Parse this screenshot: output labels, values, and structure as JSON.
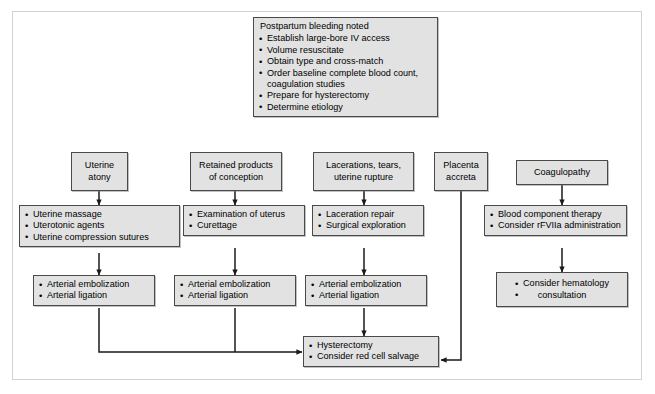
{
  "diagram": {
    "colors": {
      "box_fill": "#e2e2e2",
      "box_border": "#4a4a4a",
      "connector": "#1a1a1a",
      "frame": "#d2d2d2",
      "page_background": "#ffffff"
    }
  },
  "nodes": {
    "initial": {
      "heading": "Postpartum bleeding noted",
      "items": [
        "Establish large-bore IV access",
        "Volume resuscitate",
        "Obtain type and cross-match",
        "Order baseline complete blood count, coagulation studies",
        "Prepare for hysterectomy",
        "Determine etiology"
      ]
    },
    "etiologies": [
      {
        "name": "uterine-atony",
        "line1": "Uterine",
        "line2": "atony"
      },
      {
        "name": "retained-products",
        "line1": "Retained products",
        "line2": "of conception"
      },
      {
        "name": "lacerations",
        "line1": "Lacerations, tears,",
        "line2": "uterine rupture"
      },
      {
        "name": "placenta-accreta",
        "line1": "Placenta",
        "line2": "accreta"
      },
      {
        "name": "coagulopathy",
        "line1": "Coagulopathy",
        "line2": ""
      }
    ],
    "first_line": [
      {
        "name": "atony-first-line",
        "items": [
          "Uterine massage",
          "Uterotonic agents",
          "Uterine compression sutures"
        ]
      },
      {
        "name": "retained-first-line",
        "items": [
          "Examination of uterus",
          "Curettage"
        ]
      },
      {
        "name": "laceration-first-line",
        "items": [
          "Laceration repair",
          "Surgical exploration"
        ]
      },
      {
        "name": "coagulopathy-first-line",
        "items": [
          "Blood component therapy",
          "Consider rFVIIa administration"
        ]
      }
    ],
    "second_line": [
      {
        "name": "atony-second-line",
        "items": [
          "Arterial embolization",
          "Arterial ligation"
        ]
      },
      {
        "name": "retained-second-line",
        "items": [
          "Arterial embolization",
          "Arterial ligation"
        ]
      },
      {
        "name": "laceration-second-line",
        "items": [
          "Arterial embolization",
          "Arterial ligation"
        ]
      },
      {
        "name": "coagulopathy-second-line",
        "items": [
          "Consider hematology",
          "consultation"
        ]
      }
    ],
    "definitive": {
      "name": "hysterectomy",
      "items": [
        "Hysterectomy",
        "Consider red cell salvage"
      ]
    }
  }
}
